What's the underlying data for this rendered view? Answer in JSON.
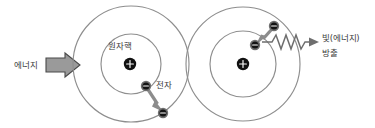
{
  "diagram": {
    "background_color": "#ffffff",
    "width": 375,
    "height": 128,
    "colors": {
      "orbit_stroke": "#8e8e8e",
      "nucleus_fill": "#111111",
      "electron_fill": "#141414",
      "electron_ring": "#6f6f6f",
      "jump_arrow": "#8c8c8c",
      "wave_arrow": "#6e6e6e",
      "block_arrow_fill": "#9a9a9a",
      "block_arrow_stroke": "#4a4a4a",
      "text": "#3b3b3b"
    },
    "labels": {
      "energy_in": "에너지",
      "nucleus": "원자핵",
      "electron": "전자",
      "emission_line1": "빛(에너지)",
      "emission_line2": "방출"
    },
    "left_atom": {
      "name": "absorption-atom",
      "center_x": 131,
      "center_y": 64,
      "outer_orbit_radius": 58,
      "inner_orbit_radius": 30,
      "nucleus_charge": "+",
      "electron_charge": "−",
      "electron_start": {
        "x": 146,
        "y": 86
      },
      "electron_end": {
        "x": 161,
        "y": 111
      },
      "transition": "inner-to-outer"
    },
    "right_atom": {
      "name": "emission-atom",
      "center_x": 243,
      "center_y": 64,
      "outer_orbit_radius": 57,
      "inner_orbit_radius": 33,
      "nucleus_charge": "+",
      "electron_charge": "−",
      "electron_start": {
        "x": 273,
        "y": 26
      },
      "electron_end": {
        "x": 256,
        "y": 45
      },
      "transition": "outer-to-inner"
    },
    "energy_arrow": {
      "name": "energy-input-arrow",
      "direction": "right",
      "x": 46,
      "y": 54,
      "width": 34,
      "height": 22
    },
    "wave_arrow": {
      "name": "photon-emission-wave",
      "direction": "right",
      "start_x": 262,
      "end_x": 312,
      "y": 42,
      "peaks": 5,
      "amplitude": 6
    }
  }
}
